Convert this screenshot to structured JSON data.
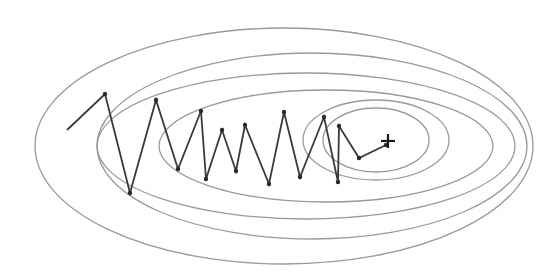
{
  "diagram": {
    "colors": {
      "background": "#ffffff",
      "contour": "#9a9a9a",
      "trajectory": "#3a3a3a",
      "minimum_marker": "#1a1a1a"
    },
    "contours": [
      {
        "cx": 284,
        "cy": 146,
        "rx": 249,
        "ry": 118
      },
      {
        "cx": 312,
        "cy": 146,
        "rx": 215,
        "ry": 93
      },
      {
        "cx": 306,
        "cy": 146,
        "rx": 209,
        "ry": 73
      },
      {
        "cx": 326,
        "cy": 146,
        "rx": 167,
        "ry": 56
      },
      {
        "cx": 376,
        "cy": 140,
        "rx": 73,
        "ry": 40
      },
      {
        "cx": 376,
        "cy": 140,
        "rx": 53,
        "ry": 32
      }
    ],
    "trajectory": [
      [
        67,
        130
      ],
      [
        105,
        94
      ],
      [
        130,
        193
      ],
      [
        156,
        100
      ],
      [
        178,
        169
      ],
      [
        201,
        111
      ],
      [
        206,
        179
      ],
      [
        222,
        130
      ],
      [
        236,
        171
      ],
      [
        245,
        125
      ],
      [
        269,
        184
      ],
      [
        284,
        112
      ],
      [
        300,
        177
      ],
      [
        324,
        117
      ],
      [
        338,
        182
      ],
      [
        339,
        126
      ],
      [
        359,
        158
      ],
      [
        386,
        145
      ]
    ],
    "minimum": {
      "x": 388,
      "y": 141,
      "arm": 7,
      "symbol": "plus-marker"
    }
  }
}
